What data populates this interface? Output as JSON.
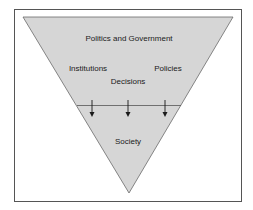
{
  "diagram": {
    "type": "inverted-triangle",
    "colors": {
      "background": "#ffffff",
      "frame": "#555555",
      "triangle_fill": "#d6d6d6",
      "triangle_stroke": "#6a6a6a",
      "divider": "#555555",
      "arrow": "#1a1a1a",
      "text": "#1a1a1a"
    },
    "top_section": {
      "title": "Politics and Government",
      "items": [
        "Institutions",
        "Decisions",
        "Policies"
      ]
    },
    "bottom_section": {
      "title": "Society"
    },
    "arrows": {
      "count": 3,
      "direction": "down"
    }
  }
}
